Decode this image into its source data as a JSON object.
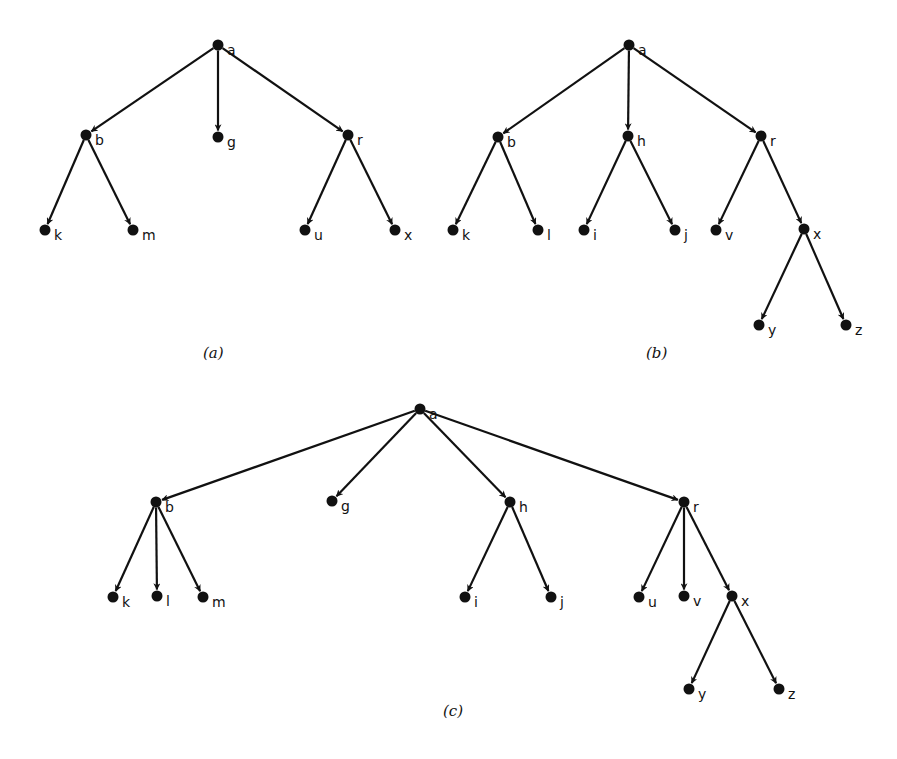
{
  "figure": {
    "trees": [
      {
        "id": "a",
        "caption": "(a)",
        "caption_pos": [
          203,
          358
        ],
        "nodes": [
          {
            "id": "a",
            "x": 218,
            "y": 45
          },
          {
            "id": "b",
            "x": 86,
            "y": 135
          },
          {
            "id": "g",
            "x": 218,
            "y": 137
          },
          {
            "id": "r",
            "x": 348,
            "y": 135
          },
          {
            "id": "k",
            "x": 45,
            "y": 230
          },
          {
            "id": "m",
            "x": 133,
            "y": 230
          },
          {
            "id": "u",
            "x": 305,
            "y": 230
          },
          {
            "id": "x",
            "x": 395,
            "y": 230
          }
        ],
        "edges": [
          [
            "a",
            "b"
          ],
          [
            "a",
            "g"
          ],
          [
            "a",
            "r"
          ],
          [
            "b",
            "k"
          ],
          [
            "b",
            "m"
          ],
          [
            "r",
            "u"
          ],
          [
            "r",
            "x"
          ]
        ]
      },
      {
        "id": "b",
        "caption": "(b)",
        "caption_pos": [
          646,
          358
        ],
        "nodes": [
          {
            "id": "a",
            "x": 629,
            "y": 45
          },
          {
            "id": "b",
            "x": 498,
            "y": 137
          },
          {
            "id": "h",
            "x": 628,
            "y": 136
          },
          {
            "id": "r",
            "x": 761,
            "y": 136
          },
          {
            "id": "k",
            "x": 453,
            "y": 230
          },
          {
            "id": "l",
            "x": 538,
            "y": 230
          },
          {
            "id": "i",
            "x": 584,
            "y": 230
          },
          {
            "id": "j",
            "x": 675,
            "y": 230
          },
          {
            "id": "v",
            "x": 716,
            "y": 230
          },
          {
            "id": "x",
            "x": 804,
            "y": 229
          },
          {
            "id": "y",
            "x": 759,
            "y": 325
          },
          {
            "id": "z",
            "x": 846,
            "y": 325
          }
        ],
        "edges": [
          [
            "a",
            "b"
          ],
          [
            "a",
            "h"
          ],
          [
            "a",
            "r"
          ],
          [
            "b",
            "k"
          ],
          [
            "b",
            "l"
          ],
          [
            "h",
            "i"
          ],
          [
            "h",
            "j"
          ],
          [
            "r",
            "v"
          ],
          [
            "r",
            "x"
          ],
          [
            "x",
            "y"
          ],
          [
            "x",
            "z"
          ]
        ]
      },
      {
        "id": "c",
        "caption": "(c)",
        "caption_pos": [
          443,
          716
        ],
        "nodes": [
          {
            "id": "a",
            "x": 420,
            "y": 409
          },
          {
            "id": "b",
            "x": 156,
            "y": 502
          },
          {
            "id": "g",
            "x": 332,
            "y": 501
          },
          {
            "id": "h",
            "x": 510,
            "y": 502
          },
          {
            "id": "r",
            "x": 684,
            "y": 502
          },
          {
            "id": "k",
            "x": 113,
            "y": 597
          },
          {
            "id": "l",
            "x": 157,
            "y": 596
          },
          {
            "id": "m",
            "x": 203,
            "y": 597
          },
          {
            "id": "i",
            "x": 465,
            "y": 597
          },
          {
            "id": "j",
            "x": 551,
            "y": 597
          },
          {
            "id": "u",
            "x": 639,
            "y": 597
          },
          {
            "id": "v",
            "x": 684,
            "y": 596
          },
          {
            "id": "x",
            "x": 732,
            "y": 596
          },
          {
            "id": "y",
            "x": 689,
            "y": 689
          },
          {
            "id": "z",
            "x": 779,
            "y": 689
          }
        ],
        "edges": [
          [
            "a",
            "b"
          ],
          [
            "a",
            "g"
          ],
          [
            "a",
            "h"
          ],
          [
            "a",
            "r"
          ],
          [
            "b",
            "k"
          ],
          [
            "b",
            "l"
          ],
          [
            "b",
            "m"
          ],
          [
            "h",
            "i"
          ],
          [
            "h",
            "j"
          ],
          [
            "r",
            "u"
          ],
          [
            "r",
            "v"
          ],
          [
            "r",
            "x"
          ],
          [
            "x",
            "y"
          ],
          [
            "x",
            "z"
          ]
        ]
      }
    ],
    "colors": {
      "ink": "#111111",
      "background": "#ffffff"
    }
  }
}
